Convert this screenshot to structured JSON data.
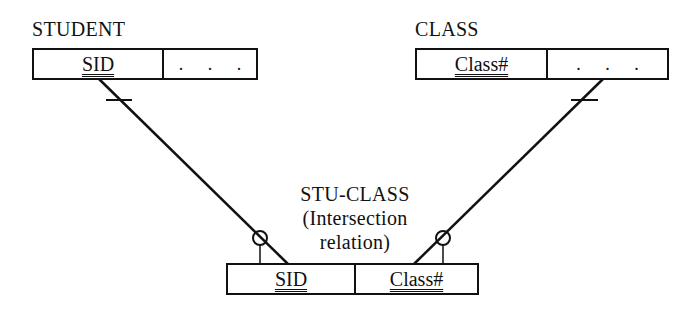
{
  "diagram": {
    "entities": [
      {
        "id": "student",
        "title": "STUDENT",
        "fields": [
          {
            "label": "SID",
            "is_key": true
          },
          {
            "label": ". . .",
            "is_key": false
          }
        ]
      },
      {
        "id": "class",
        "title": "CLASS",
        "fields": [
          {
            "label": "Class#",
            "is_key": true
          },
          {
            "label": ". . .",
            "is_key": false
          }
        ]
      },
      {
        "id": "stu_class",
        "title_lines": [
          "STU-CLASS",
          "(Intersection",
          "relation)"
        ],
        "fields": [
          {
            "label": "SID",
            "is_key": true
          },
          {
            "label": "Class#",
            "is_key": true
          }
        ]
      }
    ],
    "relationships": [
      {
        "from": "student",
        "to": "stu_class",
        "from_cardinality": "one",
        "to_cardinality": "zero-or-many"
      },
      {
        "from": "class",
        "to": "stu_class",
        "from_cardinality": "one",
        "to_cardinality": "zero-or-many"
      }
    ],
    "colors": {
      "line": "#111111",
      "background": "#ffffff"
    }
  }
}
